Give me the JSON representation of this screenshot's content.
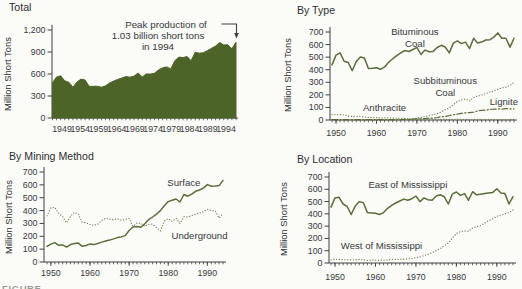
{
  "page": {
    "caption_fragment": "FIGURE"
  },
  "colors": {
    "line_green": "#5c6d3a",
    "area_green": "#4d6428",
    "dotted_green": "#6e7b52",
    "axis": "#3f4040",
    "text": "#37393b"
  },
  "chart_data": [
    {
      "id": "total",
      "type": "area",
      "title": "Total",
      "ylabel": "Million Short Tons",
      "x_range": [
        1949,
        1994
      ],
      "ylim": [
        0,
        1200
      ],
      "y_ticks": [
        {
          "v": 0,
          "label": "0"
        },
        {
          "v": 300,
          "label": "300"
        },
        {
          "v": 600,
          "label": "600"
        },
        {
          "v": 900,
          "label": "900"
        },
        {
          "v": 1200,
          "label": "1,200"
        }
      ],
      "x_tick_labels": [
        "1949",
        "1954",
        "1959",
        "1964",
        "1969",
        "1974",
        "1979",
        "1984",
        "1989",
        "1994"
      ],
      "series": [
        {
          "name": "Total",
          "style": "area",
          "values": [
            480,
            560,
            576,
            507,
            488,
            420,
            491,
            530,
            518,
            431,
            432,
            434,
            420,
            439,
            477,
            504,
            527,
            546,
            564,
            556,
            571,
            613,
            561,
            602,
            599,
            610,
            655,
            685,
            697,
            670,
            781,
            830,
            824,
            838,
            782,
            896,
            884,
            890,
            919,
            950,
            981,
            1029,
            996,
            998,
            945,
            1034
          ]
        }
      ],
      "labels": [],
      "annotation": {
        "lines": [
          "Peak production of",
          "1.03 billion short tons",
          "in 1994"
        ]
      }
    },
    {
      "id": "by-type",
      "type": "line",
      "title": "By Type",
      "ylabel": "Million Short Tons",
      "x_range": [
        1949,
        1994
      ],
      "ylim": [
        0,
        700
      ],
      "y_ticks": [
        {
          "v": 0,
          "label": "0"
        },
        {
          "v": 100,
          "label": "100"
        },
        {
          "v": 200,
          "label": "200"
        },
        {
          "v": 300,
          "label": "300"
        },
        {
          "v": 400,
          "label": "400"
        },
        {
          "v": 500,
          "label": "500"
        },
        {
          "v": 600,
          "label": "600"
        },
        {
          "v": 700,
          "label": "700"
        }
      ],
      "x_ticks": [
        {
          "v": 1950,
          "label": "1950"
        },
        {
          "v": 1960,
          "label": "1960"
        },
        {
          "v": 1970,
          "label": "1970"
        },
        {
          "v": 1980,
          "label": "1980"
        },
        {
          "v": 1990,
          "label": "1990"
        }
      ],
      "series": [
        {
          "name": "Anthracite",
          "style": "dotted",
          "values": [
            43,
            44,
            42,
            41,
            31,
            29,
            29,
            28,
            25,
            21,
            20,
            18,
            17,
            17,
            18,
            17,
            15,
            13,
            12,
            11,
            10,
            9,
            9,
            7,
            7,
            6,
            6,
            6,
            6,
            5,
            5,
            6,
            5,
            5,
            4,
            4,
            5,
            4,
            4,
            4,
            3,
            3,
            3,
            3,
            4,
            5
          ]
        },
        {
          "name": "Subbituminous Coal",
          "style": "dotted",
          "values": [
            0,
            0,
            0,
            0,
            0,
            0,
            0,
            0,
            0,
            0,
            0,
            0,
            0,
            0,
            0,
            0,
            0,
            1,
            1,
            2,
            3,
            16,
            22,
            27,
            34,
            42,
            51,
            64,
            82,
            96,
            121,
            148,
            159,
            167,
            151,
            179,
            192,
            199,
            209,
            223,
            231,
            244,
            255,
            262,
            274,
            300
          ]
        },
        {
          "name": "Lignite",
          "style": "dashdot",
          "values": [
            3,
            3,
            3,
            3,
            3,
            2,
            2,
            2,
            2,
            2,
            2,
            2,
            3,
            3,
            3,
            3,
            3,
            4,
            5,
            5,
            7,
            8,
            9,
            11,
            14,
            15,
            20,
            26,
            28,
            34,
            42,
            47,
            53,
            57,
            58,
            63,
            72,
            77,
            79,
            85,
            86,
            88,
            87,
            90,
            89,
            88
          ]
        },
        {
          "name": "Bituminous Coal",
          "style": "solid",
          "values": [
            438,
            516,
            534,
            467,
            457,
            392,
            465,
            501,
            493,
            410,
            412,
            415,
            403,
            422,
            459,
            487,
            512,
            534,
            553,
            545,
            561,
            578,
            521,
            556,
            543,
            546,
            577,
            594,
            581,
            534,
            612,
            629,
            608,
            620,
            568,
            650,
            613,
            620,
            636,
            638,
            659,
            693,
            650,
            651,
            580,
            650
          ]
        }
      ],
      "labels": [
        {
          "lines": [
            "Bituminous",
            "Coal"
          ],
          "x": 1969.5,
          "y": 680
        },
        {
          "lines": [
            "Subbituminous",
            "Coal"
          ],
          "x": 1977,
          "y": 286
        },
        {
          "lines": [
            "Anthracite"
          ],
          "x": 1962,
          "y": 72
        },
        {
          "lines": [
            "Lignite"
          ],
          "x": 1991.5,
          "y": 118
        }
      ]
    },
    {
      "id": "by-mining-method",
      "type": "line",
      "title": "By Mining Method",
      "ylabel": "Million Short Tons",
      "x_range": [
        1949,
        1994
      ],
      "ylim": [
        0,
        700
      ],
      "y_ticks": [
        {
          "v": 0,
          "label": "0"
        },
        {
          "v": 100,
          "label": "100"
        },
        {
          "v": 200,
          "label": "200"
        },
        {
          "v": 300,
          "label": "300"
        },
        {
          "v": 400,
          "label": "400"
        },
        {
          "v": 500,
          "label": "500"
        },
        {
          "v": 600,
          "label": "600"
        },
        {
          "v": 700,
          "label": "700"
        }
      ],
      "x_ticks": [
        {
          "v": 1950,
          "label": "1950"
        },
        {
          "v": 1960,
          "label": "1960"
        },
        {
          "v": 1970,
          "label": "1970"
        },
        {
          "v": 1980,
          "label": "1980"
        },
        {
          "v": 1990,
          "label": "1990"
        }
      ],
      "series": [
        {
          "name": "Underground",
          "style": "dotted",
          "values": [
            359,
            421,
            425,
            377,
            355,
            304,
            356,
            387,
            371,
            309,
            304,
            292,
            285,
            295,
            322,
            341,
            333,
            330,
            335,
            325,
            330,
            340,
            277,
            305,
            300,
            278,
            293,
            295,
            267,
            242,
            320,
            337,
            316,
            339,
            300,
            352,
            350,
            360,
            372,
            382,
            390,
            410,
            402,
            398,
            342,
            378
          ]
        },
        {
          "name": "Surface",
          "style": "solid",
          "values": [
            121,
            139,
            151,
            130,
            133,
            116,
            135,
            143,
            147,
            122,
            128,
            141,
            135,
            144,
            155,
            163,
            170,
            180,
            190,
            195,
            205,
            245,
            272,
            276,
            270,
            298,
            330,
            350,
            372,
            400,
            438,
            470,
            480,
            490,
            467,
            525,
            512,
            527,
            550,
            560,
            575,
            602,
            589,
            591,
            594,
            635
          ]
        }
      ],
      "labels": [
        {
          "lines": [
            "Surface"
          ],
          "x": 1984,
          "y": 590
        },
        {
          "lines": [
            "Underground"
          ],
          "x": 1988,
          "y": 180
        }
      ]
    },
    {
      "id": "by-location",
      "type": "line",
      "title": "By Location",
      "ylabel": "Million Short Tons",
      "x_range": [
        1949,
        1994
      ],
      "ylim": [
        0,
        700
      ],
      "y_ticks": [
        {
          "v": 0,
          "label": "0"
        },
        {
          "v": 100,
          "label": "100"
        },
        {
          "v": 200,
          "label": "200"
        },
        {
          "v": 300,
          "label": "300"
        },
        {
          "v": 400,
          "label": "400"
        },
        {
          "v": 500,
          "label": "500"
        },
        {
          "v": 600,
          "label": "600"
        },
        {
          "v": 700,
          "label": "700"
        }
      ],
      "x_ticks": [
        {
          "v": 1950,
          "label": "1950"
        },
        {
          "v": 1960,
          "label": "1960"
        },
        {
          "v": 1970,
          "label": "1970"
        },
        {
          "v": 1980,
          "label": "1980"
        },
        {
          "v": 1990,
          "label": "1990"
        }
      ],
      "series": [
        {
          "name": "West of Mississippi",
          "style": "dotted",
          "values": [
            26,
            30,
            30,
            26,
            27,
            25,
            26,
            29,
            28,
            22,
            23,
            22,
            22,
            24,
            26,
            28,
            29,
            30,
            32,
            33,
            35,
            44,
            50,
            60,
            70,
            85,
            102,
            117,
            140,
            163,
            200,
            240,
            255,
            262,
            258,
            285,
            295,
            305,
            325,
            345,
            360,
            380,
            390,
            400,
            410,
            432
          ]
        },
        {
          "name": "East of Mississippi",
          "style": "solid",
          "values": [
            455,
            530,
            535,
            480,
            460,
            395,
            465,
            500,
            490,
            410,
            408,
            405,
            395,
            410,
            445,
            470,
            488,
            505,
            520,
            510,
            523,
            545,
            500,
            530,
            515,
            510,
            545,
            555,
            540,
            480,
            560,
            578,
            550,
            565,
            510,
            580,
            555,
            560,
            565,
            570,
            575,
            605,
            570,
            565,
            480,
            540
          ]
        }
      ],
      "labels": [
        {
          "lines": [
            "East of Mississippi"
          ],
          "x": 1968,
          "y": 610
        },
        {
          "lines": [
            "West of Mississippi"
          ],
          "x": 1961.5,
          "y": 115
        }
      ]
    }
  ]
}
